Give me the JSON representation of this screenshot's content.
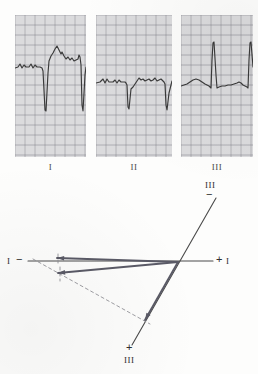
{
  "figure": {
    "background_color": "#fdfdfc",
    "trace_color": "#3a3a3a",
    "grid_color": "#b9b9bd",
    "grid_bold_color": "#8e8e95",
    "paper_color": "#efefef"
  },
  "ecg": {
    "strips": [
      {
        "id": "lead-i",
        "label": "I",
        "x": 15,
        "y": 15,
        "width": 71,
        "height": 142,
        "baseline_y": 52,
        "description": "Lead I: deep negative QS complexes, predominantly negative deflection",
        "trace_points": "0,53 3,52 5,49 7,53 9,50 11,52 14,52 16,49 18,53 20,50 22,52 25,52 27,53 28,56 30,95 31,96 33,58 34,46 36,41 38,38 40,34 42,31 44,35 46,39 47,37 49,41 51,44 53,42 55,45 57,43 59,46 61,45 63,44 64,40 65,42 66,50 67,90 68,96 70,60 71,52"
      },
      {
        "id": "lead-ii",
        "label": "II",
        "x": 96,
        "y": 15,
        "width": 76,
        "height": 142,
        "baseline_y": 66,
        "description": "Lead II: biphasic complexes with deep S waves",
        "trace_points": "0,68 4,67 7,64 9,68 11,64 13,67 17,67 19,65 21,68 23,65 25,67 29,67 30,68 31,70 32,92 33,94 35,74 37,72 39,69 41,66 43,63 45,65 47,64 49,66 51,65 53,64 55,66 57,65 59,63 61,66 63,65 65,64 67,66 68,67 69,69 70,90 71,95 73,78 75,70 76,66"
      },
      {
        "id": "lead-iii",
        "label": "III",
        "x": 181,
        "y": 15,
        "width": 72,
        "height": 142,
        "baseline_y": 70,
        "description": "Lead III: tall positive R waves, predominantly positive deflection",
        "trace_points": "0,71 3,70 6,69 9,67 12,65 15,64 18,65 21,67 24,69 26,70 28,71 29,72 30,73 31,45 32,28 33,27 35,60 36,73 38,72 41,71 44,71 47,70 50,70 53,69 56,68 58,67 60,68 62,70 64,71 66,72 67,73 68,45 69,28 70,27 72,52"
      }
    ]
  },
  "vector_diagram": {
    "description": "Axis diagram showing lead I axis (horizontal) and lead III axis (oblique) with QRS vectors directed leftward and superior, indicating left axis deviation",
    "axes": [
      {
        "id": "lead-i-axis",
        "name": "lead-i-axis-line",
        "negative_label": "I",
        "negative_sign": "−",
        "positive_label": "I",
        "positive_sign": "+",
        "x1": 28,
        "y1": 261,
        "x2": 213,
        "y2": 261
      },
      {
        "id": "lead-iii-axis",
        "name": "lead-iii-axis-line",
        "negative_label": "III",
        "negative_sign": "−",
        "positive_label": "III",
        "positive_sign": "+",
        "x1": 216,
        "y1": 198,
        "x2": 132,
        "y2": 345
      }
    ],
    "vectors": [
      {
        "id": "vector-upper",
        "name": "qrs-vector-lead-i",
        "x1": 178,
        "y1": 262,
        "x2": 57,
        "y2": 258,
        "arrowhead": "left"
      },
      {
        "id": "vector-lower",
        "name": "qrs-vector-resultant",
        "x1": 178,
        "y1": 262,
        "x2": 58,
        "y2": 273,
        "arrowhead": "left"
      },
      {
        "id": "vector-iii",
        "name": "qrs-vector-lead-iii",
        "x1": 178,
        "y1": 262,
        "x2": 145,
        "y2": 320,
        "arrowhead": "down-left"
      }
    ],
    "construction_lines": [
      {
        "id": "dashed-hypotenuse",
        "name": "dashed-projection-line",
        "x1": 33,
        "y1": 259,
        "x2": 150,
        "y2": 324
      },
      {
        "id": "tick-upper",
        "name": "dashed-tick-upper",
        "x1": 58,
        "y1": 254,
        "x2": 58,
        "y2": 266
      },
      {
        "id": "tick-lower",
        "name": "dashed-tick-lower",
        "x1": 60,
        "y1": 267,
        "x2": 60,
        "y2": 281
      }
    ],
    "labels": {
      "lead_i_negative": "I",
      "lead_i_negative_sign": "−",
      "lead_i_positive_sign": "+",
      "lead_i_positive": "I",
      "lead_iii_negative": "III",
      "lead_iii_negative_sign": "−",
      "lead_iii_positive_sign": "+",
      "lead_iii_positive": "III"
    }
  }
}
